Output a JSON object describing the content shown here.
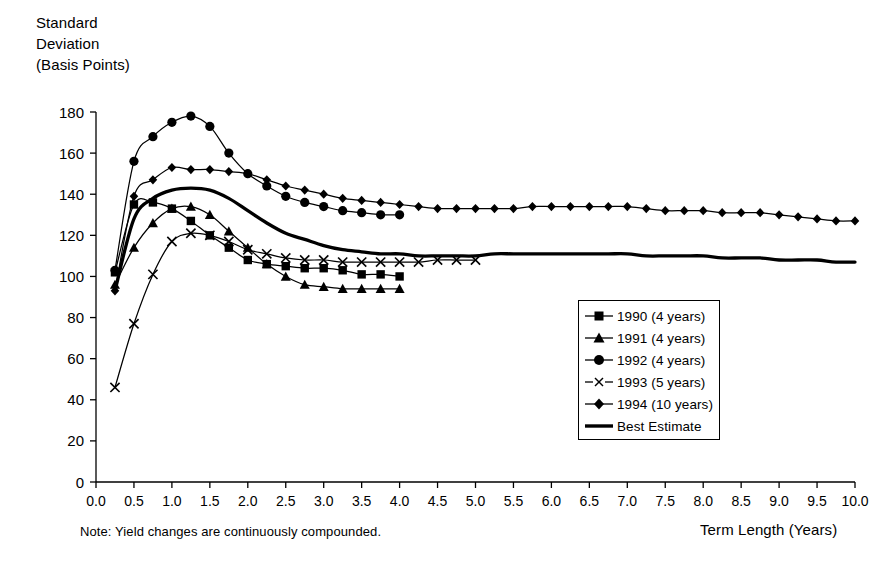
{
  "chart_data": {
    "type": "line",
    "title": "",
    "ylabel": "Standard\nDeviation\n(Basis Points)",
    "xlabel": "Term Length (Years)",
    "note": "Note: Yield changes are continuously compounded.",
    "xlim": [
      0.0,
      10.0
    ],
    "ylim": [
      0,
      180
    ],
    "xticks": [
      "0.0",
      "0.5",
      "1.0",
      "1.5",
      "2.0",
      "2.5",
      "3.0",
      "3.5",
      "4.0",
      "4.5",
      "5.0",
      "5.5",
      "6.0",
      "6.5",
      "7.0",
      "7.5",
      "8.0",
      "8.5",
      "9.0",
      "9.5",
      "10.0"
    ],
    "yticks": [
      "0",
      "20",
      "40",
      "60",
      "80",
      "100",
      "120",
      "140",
      "160",
      "180"
    ],
    "grid": false,
    "legend_position": "center-right",
    "series": [
      {
        "name": "1990 (4 years)",
        "marker": "square",
        "x": [
          0.25,
          0.5,
          0.75,
          1.0,
          1.25,
          1.5,
          1.75,
          2.0,
          2.25,
          2.5,
          2.75,
          3.0,
          3.25,
          3.5,
          3.75,
          4.0
        ],
        "values": [
          102,
          135,
          136,
          133,
          127,
          120,
          114,
          108,
          106,
          105,
          104,
          104,
          103,
          101,
          101,
          100
        ]
      },
      {
        "name": "1991 (4 years)",
        "marker": "triangle",
        "x": [
          0.25,
          0.5,
          0.75,
          1.0,
          1.25,
          1.5,
          1.75,
          2.0,
          2.25,
          2.5,
          2.75,
          3.0,
          3.25,
          3.5,
          3.75,
          4.0
        ],
        "values": [
          96,
          114,
          126,
          133,
          134,
          130,
          122,
          114,
          106,
          100,
          96,
          95,
          94,
          94,
          94,
          94
        ]
      },
      {
        "name": "1992 (4 years)",
        "marker": "circle",
        "x": [
          0.25,
          0.5,
          0.75,
          1.0,
          1.25,
          1.5,
          1.75,
          2.0,
          2.25,
          2.5,
          2.75,
          3.0,
          3.25,
          3.5,
          3.75,
          4.0
        ],
        "values": [
          103,
          156,
          168,
          175,
          178,
          173,
          160,
          150,
          144,
          139,
          136,
          134,
          132,
          131,
          130,
          130
        ]
      },
      {
        "name": "1993 (5 years)",
        "marker": "x",
        "x": [
          0.25,
          0.5,
          0.75,
          1.0,
          1.25,
          1.5,
          1.75,
          2.0,
          2.25,
          2.5,
          2.75,
          3.0,
          3.25,
          3.5,
          3.75,
          4.0,
          4.25,
          4.5,
          4.75,
          5.0
        ],
        "values": [
          46,
          77,
          101,
          117,
          121,
          120,
          117,
          113,
          111,
          109,
          108,
          108,
          107,
          107,
          107,
          107,
          107,
          108,
          108,
          108
        ]
      },
      {
        "name": "1994 (10 years)",
        "marker": "diamond",
        "x": [
          0.25,
          0.5,
          0.75,
          1.0,
          1.25,
          1.5,
          1.75,
          2.0,
          2.25,
          2.5,
          2.75,
          3.0,
          3.25,
          3.5,
          3.75,
          4.0,
          4.25,
          4.5,
          4.75,
          5.0,
          5.25,
          5.5,
          5.75,
          6.0,
          6.25,
          6.5,
          6.75,
          7.0,
          7.25,
          7.5,
          7.75,
          8.0,
          8.25,
          8.5,
          8.75,
          9.0,
          9.25,
          9.5,
          9.75,
          10.0
        ],
        "values": [
          93,
          139,
          147,
          153,
          152,
          152,
          151,
          150,
          147,
          144,
          142,
          140,
          138,
          137,
          136,
          135,
          134,
          133,
          133,
          133,
          133,
          133,
          134,
          134,
          134,
          134,
          134,
          134,
          133,
          132,
          132,
          132,
          131,
          131,
          131,
          130,
          129,
          128,
          127,
          127
        ]
      },
      {
        "name": "Best Estimate",
        "marker": "none",
        "x": [
          0.25,
          0.5,
          0.75,
          1.0,
          1.25,
          1.5,
          1.75,
          2.0,
          2.25,
          2.5,
          2.75,
          3.0,
          3.25,
          3.5,
          3.75,
          4.0,
          4.25,
          4.5,
          4.75,
          5.0,
          5.25,
          5.5,
          5.75,
          6.0,
          6.25,
          6.5,
          6.75,
          7.0,
          7.25,
          7.5,
          7.75,
          8.0,
          8.25,
          8.5,
          8.75,
          9.0,
          9.25,
          9.5,
          9.75,
          10.0
        ],
        "values": [
          93,
          128,
          138,
          142,
          143,
          142,
          138,
          132,
          126,
          121,
          118,
          115,
          113,
          112,
          111,
          111,
          110,
          110,
          110,
          110,
          111,
          111,
          111,
          111,
          111,
          111,
          111,
          111,
          110,
          110,
          110,
          110,
          109,
          109,
          109,
          108,
          108,
          108,
          107,
          107
        ]
      }
    ]
  },
  "legend": {
    "items": [
      {
        "label": "1990 (4 years)",
        "marker": "square"
      },
      {
        "label": "1991 (4 years)",
        "marker": "triangle"
      },
      {
        "label": "1992 (4 years)",
        "marker": "circle"
      },
      {
        "label": "1993 (5 years)",
        "marker": "x"
      },
      {
        "label": "1994 (10 years)",
        "marker": "diamond"
      },
      {
        "label": "Best Estimate",
        "marker": "none"
      }
    ]
  },
  "colors": {
    "line": "#000000",
    "background": "#ffffff",
    "axis": "#000000"
  }
}
